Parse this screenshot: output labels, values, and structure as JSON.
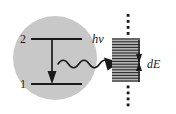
{
  "figure": {
    "background_color": "#ffffff",
    "width": 176,
    "height": 114
  },
  "atom": {
    "shape": "circle",
    "fill_color": "#c8c8c8",
    "center_x": 55,
    "center_y": 58,
    "radius": 42,
    "levels": [
      {
        "id": "upper",
        "label": "2",
        "y": 39,
        "x_start": 30,
        "x_end": 82
      },
      {
        "id": "lower",
        "label": "1",
        "y": 84,
        "x_start": 30,
        "x_end": 82
      }
    ],
    "transition_arrow": {
      "name": "downward-transition-arrow",
      "direction": "down",
      "x": 52,
      "y_start": 39,
      "y_end": 84,
      "color": "#1a1a1a"
    }
  },
  "photon": {
    "label": "hν",
    "label_x": 92,
    "label_y": 43,
    "wave": {
      "name": "photon-wavy-arrow",
      "x_start": 58,
      "x_end": 118,
      "y": 64,
      "amplitude": 6,
      "cycles": 5.5,
      "color": "#1a1a1a"
    }
  },
  "band": {
    "name": "quasicontinuum-band",
    "x": 112,
    "y": 38,
    "width": 28,
    "height": 44,
    "fill_color": "#b4b4b4",
    "line_color": "#2b2b2b",
    "line_count": 16,
    "dotted_axis": {
      "name": "dotted-vertical-axis",
      "x": 128,
      "y_top": 14,
      "y_bottom": 106,
      "color": "#1a1a1a",
      "dot_size": 2.6
    },
    "spacing_marker": {
      "name": "level-spacing-double-arrow",
      "label": "dE",
      "label_x": 149,
      "label_y": 64,
      "x": 139,
      "y_top": 44,
      "y_bottom": 78,
      "color": "#1a1a1a"
    }
  },
  "colors": {
    "ink": "#1a1a1a",
    "atom_gray": "#c8c8c8",
    "band_gray": "#b4b4b4",
    "paper": "#ffffff"
  }
}
